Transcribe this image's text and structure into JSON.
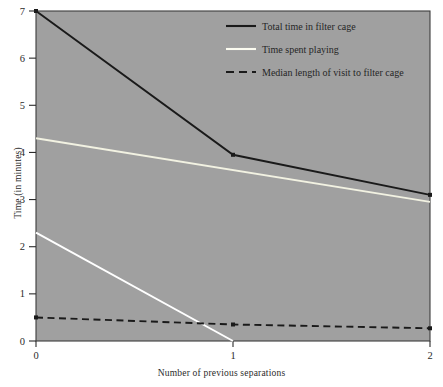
{
  "chart_data": {
    "type": "line",
    "title": "",
    "xlabel": "Number of previous separations",
    "ylabel": "Time (in minutes)",
    "x": [
      0,
      1,
      2
    ],
    "xlim": [
      0,
      2
    ],
    "ylim": [
      0,
      7
    ],
    "xticks": [
      "0",
      "1",
      "2"
    ],
    "yticks": [
      "0",
      "1",
      "2",
      "3",
      "4",
      "5",
      "6",
      "7"
    ],
    "grid": false,
    "legend_position": "top-right",
    "plot_background": "#a0a0a0",
    "page_background": "#ffffff",
    "series": [
      {
        "name": "Total time in filter cage",
        "color": "#1a1a1a",
        "style": "solid",
        "x": [
          0,
          1,
          2
        ],
        "values": [
          7.0,
          3.95,
          3.1
        ]
      },
      {
        "name": "Time spent playing",
        "color": "#f2f2e2",
        "style": "solid",
        "x": [
          0,
          2
        ],
        "values": [
          4.3,
          2.95
        ]
      },
      {
        "name": "Time spent playing",
        "color": "#ffffff",
        "style": "solid",
        "x": [
          0,
          1
        ],
        "values": [
          2.3,
          0.0
        ]
      },
      {
        "name": "Median length of visit to filter cage",
        "color": "#1a1a1a",
        "style": "dashed",
        "x": [
          0,
          1,
          2
        ],
        "values": [
          0.5,
          0.35,
          0.27
        ]
      }
    ],
    "legend": [
      {
        "label": "Total time in filter cage",
        "color": "#1a1a1a",
        "style": "solid"
      },
      {
        "label": "Time spent playing",
        "color": "#fbfbf0",
        "style": "solid"
      },
      {
        "label": "Median length of visit to filter cage",
        "color": "#1a1a1a",
        "style": "dashed"
      }
    ]
  }
}
